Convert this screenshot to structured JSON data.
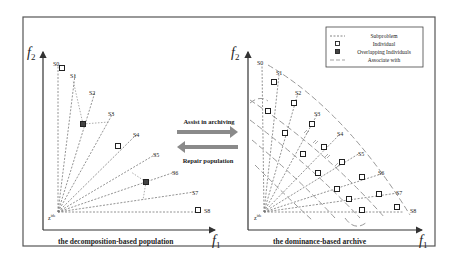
{
  "frame": {
    "border_color": "#444444"
  },
  "arrows": {
    "assist": {
      "label": "Assist in archiving",
      "color": "#8a8a8a"
    },
    "repair": {
      "label": "Repair population",
      "color": "#8a8a8a"
    }
  },
  "legend": {
    "items": [
      {
        "symbol": "dashed-line",
        "label": "Subproblem"
      },
      {
        "symbol": "hollow-square",
        "label": "Individual"
      },
      {
        "symbol": "filled-square",
        "label": "Overlapping Individuals"
      },
      {
        "symbol": "long-dashed-line",
        "label": "Associate with"
      }
    ]
  },
  "left_panel": {
    "title": "the decomposition-based population",
    "y_axis_label": "f2",
    "x_axis_label": "f1",
    "origin_label": "z*",
    "subproblems": [
      "S0",
      "S1",
      "S2",
      "S3",
      "S4",
      "S5",
      "S6",
      "S7",
      "S8"
    ]
  },
  "right_panel": {
    "title": "the dominance-based archive",
    "y_axis_label": "f2",
    "x_axis_label": "f1",
    "origin_label": "z*",
    "subproblems": [
      "S0",
      "S1",
      "S2",
      "S3",
      "S4",
      "S5",
      "S6",
      "S7",
      "S8"
    ]
  }
}
